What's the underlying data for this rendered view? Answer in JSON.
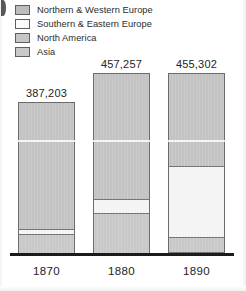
{
  "chart_data": {
    "type": "bar",
    "subtype": "stacked-bar",
    "title": "",
    "xlabel": "",
    "ylabel": "",
    "grid": false,
    "legend_position": "top-left",
    "categories": [
      "1870",
      "1880",
      "1890"
    ],
    "totals": [
      "387,203",
      "457,257",
      "455,302"
    ],
    "totals_numeric": [
      387203,
      457257,
      455302
    ],
    "series": [
      {
        "name": "Northern & Western Europe",
        "swatch": "sw-nwe",
        "segment_class": "seg-nwe",
        "color": "#c3c3c3",
        "values": [
          320000,
          345000,
          230000
        ]
      },
      {
        "name": "Southern & Eastern Europe",
        "swatch": "sw-see",
        "segment_class": "seg-see",
        "color": "#f4f4f4",
        "values": [
          12000,
          36000,
          178000
        ]
      },
      {
        "name": "North America",
        "swatch": "sw-na",
        "segment_class": "seg-na",
        "color": "#c8c8c8",
        "values": [
          52000,
          72000,
          40000
        ]
      },
      {
        "name": "Asia",
        "swatch": "sw-asia",
        "segment_class": "seg-asia",
        "color": "#cbcbcb",
        "values": [
          3203,
          4257,
          7302
        ]
      }
    ],
    "bars": [
      {
        "category": "1870",
        "total_label": "387,203",
        "left_px": 18,
        "width_px": 57,
        "height_px": 153,
        "segments": [
          {
            "series": "Northern & Western Europe",
            "segment_class": "seg-nwe",
            "height_px": 126
          },
          {
            "series": "Southern & Eastern Europe",
            "segment_class": "seg-see",
            "height_px": 5
          },
          {
            "series": "North America",
            "segment_class": "seg-na",
            "height_px": 19
          },
          {
            "series": "Asia",
            "segment_class": "seg-asia",
            "height_px": 3
          }
        ]
      },
      {
        "category": "1880",
        "total_label": "457,257",
        "left_px": 93,
        "width_px": 57,
        "height_px": 182,
        "segments": [
          {
            "series": "Northern & Western Europe",
            "segment_class": "seg-nwe",
            "height_px": 125
          },
          {
            "series": "Southern & Eastern Europe",
            "segment_class": "seg-see",
            "height_px": 14
          },
          {
            "series": "North America",
            "segment_class": "seg-na",
            "height_px": 40
          },
          {
            "series": "Asia",
            "segment_class": "seg-asia",
            "height_px": 3
          }
        ]
      },
      {
        "category": "1890",
        "total_label": "455,302",
        "left_px": 168,
        "width_px": 57,
        "height_px": 182,
        "segments": [
          {
            "series": "Northern & Western Europe",
            "segment_class": "seg-nwe",
            "height_px": 92
          },
          {
            "series": "Southern & Eastern Europe",
            "segment_class": "seg-see",
            "height_px": 71
          },
          {
            "series": "North America",
            "segment_class": "seg-na",
            "height_px": 15
          },
          {
            "series": "Asia",
            "segment_class": "seg-asia",
            "height_px": 4
          }
        ]
      }
    ]
  },
  "legend": {
    "items": [
      {
        "label": "Northern & Western Europe",
        "swatch": "sw-nwe"
      },
      {
        "label": "Southern & Eastern Europe",
        "swatch": "sw-see"
      },
      {
        "label": "North America",
        "swatch": "sw-na"
      },
      {
        "label": "Asia",
        "swatch": "sw-asia"
      }
    ]
  }
}
